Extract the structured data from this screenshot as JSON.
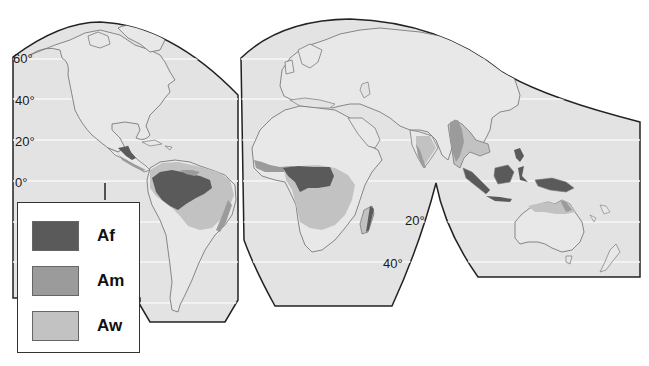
{
  "map": {
    "projection": "interrupted",
    "colors": {
      "ocean": "#e3e3e3",
      "land": "#e8e8e8",
      "coastline": "#7a7a7a",
      "outline": "#222222",
      "gridline": "#f7f7f7",
      "Af": "#5a5a5a",
      "Am": "#9b9b9b",
      "Aw": "#c2c2c2"
    },
    "latitude_labels": [
      {
        "id": "lat-60",
        "text": "60°",
        "x": 13,
        "y": 193
      },
      {
        "id": "lat-40",
        "text": "40°",
        "x": 15,
        "y": 95
      },
      {
        "id": "lat-20",
        "text": "20°",
        "x": 15,
        "y": 136
      },
      {
        "id": "lat-0",
        "text": "0°",
        "x": 15,
        "y": 177
      },
      {
        "id": "lat-20s",
        "text": "20°",
        "x": 405,
        "y": 215
      },
      {
        "id": "lat-40s",
        "text": "40°",
        "x": 383,
        "y": 258
      }
    ]
  },
  "legend": {
    "items": [
      {
        "code": "Af",
        "color": "#5a5a5a"
      },
      {
        "code": "Am",
        "color": "#9b9b9b"
      },
      {
        "code": "Aw",
        "color": "#c2c2c2"
      }
    ]
  }
}
